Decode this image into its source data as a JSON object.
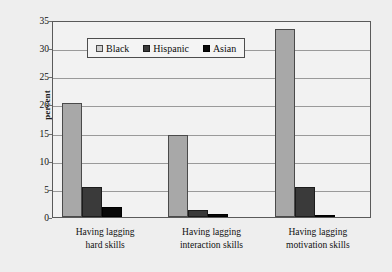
{
  "chart_data": {
    "type": "bar",
    "title": "",
    "subtitle": "",
    "xlabel": "",
    "ylabel": "percent",
    "ylim": [
      0,
      35
    ],
    "yticks": [
      0,
      5,
      10,
      15,
      20,
      25,
      30,
      35
    ],
    "ytick_labels": [
      "0",
      "5",
      "10",
      "15",
      "20",
      "25",
      "30",
      "35"
    ],
    "grid": true,
    "legend_position": "top-center-inside",
    "categories": [
      "Having lagging hard skills",
      "Having lagging interaction skills",
      "Having lagging motivation skills"
    ],
    "category_lines": [
      [
        "Having lagging",
        "hard skills"
      ],
      [
        "Having lagging",
        "interaction skills"
      ],
      [
        "Having lagging",
        "motivation skills"
      ]
    ],
    "series": [
      {
        "name": "Black",
        "color": "#a8a8a8",
        "values": [
          20.3,
          14.6,
          33.4
        ]
      },
      {
        "name": "Hispanic",
        "color": "#3a3a3a",
        "values": [
          5.3,
          1.2,
          5.4
        ]
      },
      {
        "name": "Asian",
        "color": "#080808",
        "values": [
          1.7,
          0.6,
          0.3
        ]
      }
    ]
  },
  "legend": {
    "items": [
      {
        "label": "Black"
      },
      {
        "label": "Hispanic"
      },
      {
        "label": "Asian"
      }
    ]
  },
  "axes": {
    "y_axis_label": "percent"
  }
}
